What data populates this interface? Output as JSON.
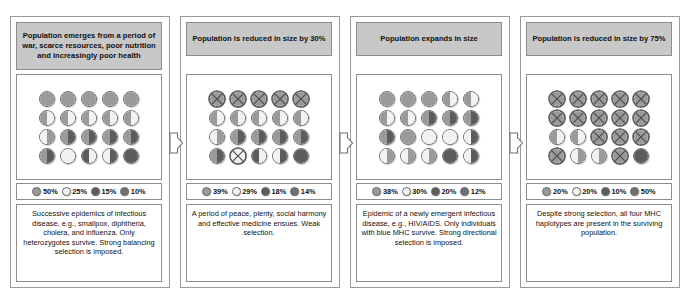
{
  "figure": {
    "colors": {
      "allele_a": "#9a9a9a",
      "allele_b": "#f2f2f2",
      "allele_c": "#5c5c5c",
      "allele_d": "#707070",
      "header_bg": "#c8c8c8",
      "frame": "#8d8d8d",
      "panel_bg": "#ffffff",
      "text": "#111111"
    },
    "arrow_icon": "arrow-right-outline-icon",
    "panels": [
      {
        "id": "panel-1",
        "header": "Population emerges from a period of war, scarce resources, poor nutrition and increasingly poor health",
        "caption": "Successive epidemics of infectious disease, e.g., smallpox, diphtheria, cholera, and influenza.\nOnly heterozygotes survive.\nStrong balancing selection is imposed.",
        "legend": [
          {
            "label": "50%",
            "swatch": "allele_a"
          },
          {
            "label": "25%",
            "swatch": "allele_b"
          },
          {
            "label": "15%",
            "swatch": "allele_c"
          },
          {
            "label": "10%",
            "swatch": "allele_d"
          }
        ],
        "grid": [
          [
            {
              "l": "a",
              "r": "a",
              "x": false
            },
            {
              "l": "a",
              "r": "a",
              "x": false
            },
            {
              "l": "a",
              "r": "a",
              "x": false
            },
            {
              "l": "a",
              "r": "a",
              "x": false
            },
            {
              "l": "a",
              "r": "a",
              "x": false
            }
          ],
          [
            {
              "l": "a",
              "r": "b",
              "x": false
            },
            {
              "l": "a",
              "r": "b",
              "x": false
            },
            {
              "l": "a",
              "r": "b",
              "x": false
            },
            {
              "l": "a",
              "r": "b",
              "x": false
            },
            {
              "l": "a",
              "r": "b",
              "x": false
            }
          ],
          [
            {
              "l": "b",
              "r": "a",
              "x": false
            },
            {
              "l": "a",
              "r": "c",
              "x": false
            },
            {
              "l": "a",
              "r": "c",
              "x": false
            },
            {
              "l": "a",
              "r": "c",
              "x": false
            },
            {
              "l": "a",
              "r": "c",
              "x": false
            }
          ],
          [
            {
              "l": "a",
              "r": "c",
              "x": false
            },
            {
              "l": "b",
              "r": "b",
              "x": false
            },
            {
              "l": "c",
              "r": "b",
              "x": false
            },
            {
              "l": "b",
              "r": "c",
              "x": false
            },
            {
              "l": "c",
              "r": "c",
              "x": false
            }
          ]
        ]
      },
      {
        "id": "panel-2",
        "header": "Population is reduced in size by 30%",
        "caption": "A period of peace, plenty, social harmony and effective medicine ensues. Weak selection.",
        "legend": [
          {
            "label": "39%",
            "swatch": "allele_a"
          },
          {
            "label": "29%",
            "swatch": "allele_b"
          },
          {
            "label": "18%",
            "swatch": "allele_c"
          },
          {
            "label": "14%",
            "swatch": "allele_d"
          }
        ],
        "grid": [
          [
            {
              "l": "a",
              "r": "a",
              "x": true
            },
            {
              "l": "a",
              "r": "a",
              "x": true
            },
            {
              "l": "a",
              "r": "a",
              "x": true
            },
            {
              "l": "a",
              "r": "a",
              "x": true
            },
            {
              "l": "a",
              "r": "a",
              "x": true
            }
          ],
          [
            {
              "l": "a",
              "r": "b",
              "x": false
            },
            {
              "l": "a",
              "r": "b",
              "x": false
            },
            {
              "l": "a",
              "r": "b",
              "x": false
            },
            {
              "l": "a",
              "r": "b",
              "x": false
            },
            {
              "l": "a",
              "r": "b",
              "x": false
            }
          ],
          [
            {
              "l": "b",
              "r": "a",
              "x": false
            },
            {
              "l": "a",
              "r": "c",
              "x": false
            },
            {
              "l": "a",
              "r": "c",
              "x": false
            },
            {
              "l": "a",
              "r": "c",
              "x": false
            },
            {
              "l": "a",
              "r": "c",
              "x": false
            }
          ],
          [
            {
              "l": "a",
              "r": "c",
              "x": false
            },
            {
              "l": "b",
              "r": "b",
              "x": true
            },
            {
              "l": "c",
              "r": "b",
              "x": false
            },
            {
              "l": "b",
              "r": "c",
              "x": false
            },
            {
              "l": "c",
              "r": "c",
              "x": false
            }
          ]
        ]
      },
      {
        "id": "panel-3",
        "header": "Population expands in size",
        "caption": "Epidemic of a newly emergent infectious disease, e.g., HIV/AIDS.\nOnly individuals with blue MHC survive.\nStrong directional selection is imposed.",
        "legend": [
          {
            "label": "38%",
            "swatch": "allele_a"
          },
          {
            "label": "30%",
            "swatch": "allele_b"
          },
          {
            "label": "20%",
            "swatch": "allele_c"
          },
          {
            "label": "12%",
            "swatch": "allele_d"
          }
        ],
        "grid": [
          [
            {
              "l": "a",
              "r": "a",
              "x": false
            },
            {
              "l": "a",
              "r": "a",
              "x": false
            },
            {
              "l": "a",
              "r": "a",
              "x": false
            },
            {
              "l": "a",
              "r": "b",
              "x": false
            },
            {
              "l": "a",
              "r": "b",
              "x": false
            }
          ],
          [
            {
              "l": "a",
              "r": "b",
              "x": false
            },
            {
              "l": "a",
              "r": "b",
              "x": false
            },
            {
              "l": "a",
              "r": "c",
              "x": false
            },
            {
              "l": "a",
              "r": "c",
              "x": false
            },
            {
              "l": "a",
              "r": "c",
              "x": false
            }
          ],
          [
            {
              "l": "a",
              "r": "c",
              "x": false
            },
            {
              "l": "a",
              "r": "a",
              "x": false
            },
            {
              "l": "b",
              "r": "b",
              "x": false
            },
            {
              "l": "b",
              "r": "b",
              "x": false
            },
            {
              "l": "b",
              "r": "c",
              "x": false
            }
          ],
          [
            {
              "l": "b",
              "r": "a",
              "x": false
            },
            {
              "l": "b",
              "r": "a",
              "x": false
            },
            {
              "l": "b",
              "r": "a",
              "x": false
            },
            {
              "l": "c",
              "r": "c",
              "x": false
            },
            {
              "l": "b",
              "r": "c",
              "x": false
            }
          ]
        ]
      },
      {
        "id": "panel-4",
        "header": "Population is reduced in size by 75%",
        "caption": "Despite strong selection, all four MHC haplotypes are present in the surviving population.",
        "legend": [
          {
            "label": "20%",
            "swatch": "allele_a"
          },
          {
            "label": "20%",
            "swatch": "allele_b"
          },
          {
            "label": "10%",
            "swatch": "allele_c"
          },
          {
            "label": "50%",
            "swatch": "allele_d"
          }
        ],
        "grid": [
          [
            {
              "l": "a",
              "r": "a",
              "x": true
            },
            {
              "l": "a",
              "r": "a",
              "x": true
            },
            {
              "l": "a",
              "r": "a",
              "x": true
            },
            {
              "l": "a",
              "r": "a",
              "x": true
            },
            {
              "l": "a",
              "r": "a",
              "x": true
            }
          ],
          [
            {
              "l": "a",
              "r": "a",
              "x": true
            },
            {
              "l": "a",
              "r": "a",
              "x": true
            },
            {
              "l": "a",
              "r": "a",
              "x": true
            },
            {
              "l": "a",
              "r": "a",
              "x": true
            },
            {
              "l": "a",
              "r": "a",
              "x": true
            }
          ],
          [
            {
              "l": "a",
              "r": "b",
              "x": false
            },
            {
              "l": "a",
              "r": "b",
              "x": false
            },
            {
              "l": "a",
              "r": "a",
              "x": true
            },
            {
              "l": "a",
              "r": "a",
              "x": true
            },
            {
              "l": "a",
              "r": "a",
              "x": true
            }
          ],
          [
            {
              "l": "a",
              "r": "a",
              "x": true
            },
            {
              "l": "b",
              "r": "a",
              "x": false
            },
            {
              "l": "b",
              "r": "a",
              "x": false
            },
            {
              "l": "a",
              "r": "a",
              "x": true
            },
            {
              "l": "c",
              "r": "c",
              "x": false
            }
          ]
        ]
      }
    ]
  },
  "chart_data": {
    "type": "table",
    "categories": [
      "Episode 1",
      "Episode 2",
      "Episode 3",
      "Episode 4"
    ],
    "series": [
      {
        "name": "Haplotype 1 (medium gray)",
        "values": [
          50,
          39,
          38,
          20
        ]
      },
      {
        "name": "Haplotype 2 (white)",
        "values": [
          25,
          29,
          30,
          20
        ]
      },
      {
        "name": "Haplotype 3 (dark)",
        "values": [
          15,
          18,
          20,
          10
        ]
      },
      {
        "name": "Haplotype 4 (darker)",
        "values": [
          10,
          14,
          12,
          50
        ]
      }
    ],
    "xlabel": "Episode",
    "ylabel": "Allele frequency (%)",
    "ylim": [
      0,
      100
    ],
    "grid": false,
    "legend_position": "below-grid"
  }
}
